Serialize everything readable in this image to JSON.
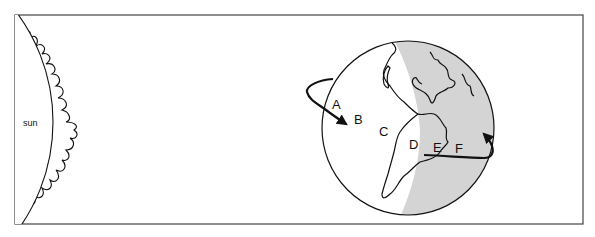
{
  "diagram": {
    "type": "sun-earth rotation illustration",
    "sun_label": "sun",
    "globe_labels": [
      "A",
      "B",
      "C",
      "D",
      "E",
      "F"
    ],
    "shading": {
      "day_side": "left (facing sun)",
      "night_side": "right (away from sun)",
      "night_color": "#d4d4d4"
    },
    "rotation_arrow": "curved arrow around globe indicating eastward rotation",
    "colors": {
      "line": "#111111",
      "background": "#ffffff",
      "frame": "#444444"
    }
  }
}
